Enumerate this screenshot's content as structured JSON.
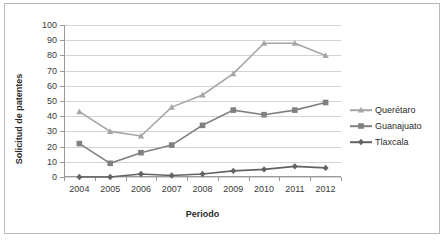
{
  "chart_data": {
    "type": "line",
    "title": "",
    "xlabel": "Periodo",
    "ylabel": "Solicitud de patentes",
    "categories": [
      "2004",
      "2005",
      "2006",
      "2007",
      "2008",
      "2009",
      "2010",
      "2011",
      "2012"
    ],
    "ylim": [
      0,
      100
    ],
    "yticks": [
      0,
      10,
      20,
      30,
      40,
      50,
      60,
      70,
      80,
      90,
      100
    ],
    "grid": true,
    "legend_position": "right",
    "series": [
      {
        "name": "Querétaro",
        "color": "#a6a6a6",
        "marker": "triangle",
        "values": [
          43,
          30,
          27,
          46,
          54,
          68,
          88,
          88,
          80
        ]
      },
      {
        "name": "Guanajuato",
        "color": "#808080",
        "marker": "square",
        "values": [
          22,
          9,
          16,
          21,
          34,
          44,
          41,
          44,
          49
        ]
      },
      {
        "name": "Tlaxcala",
        "color": "#636363",
        "marker": "diamond",
        "values": [
          0,
          0,
          2,
          1,
          2,
          4,
          5,
          7,
          6
        ]
      }
    ]
  },
  "colors": {
    "grid": "#d4d4d4",
    "axis": "#9a9a9a",
    "border": "#b8b8b8",
    "text": "#2b2b2b",
    "background": "#ffffff"
  }
}
